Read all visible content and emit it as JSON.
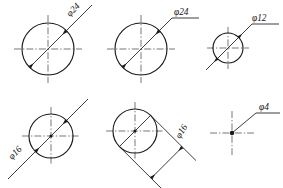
{
  "drawing": {
    "title": "Diameter dimensioning examples",
    "page_background": "#ffffff",
    "line_color": "#1a1a1a",
    "centerline_color": "#3d3d3d",
    "figures": [
      {
        "id": "fig-1",
        "name": "circle-phi24-inline-rotated-label",
        "label": "φ24",
        "diameter_value": 24,
        "symbol": "φ",
        "label_orientation": "aligned",
        "center": {
          "x": 48,
          "y": 49
        },
        "radius": 26,
        "dimension_line_angle_deg": -45,
        "arrows": "inside-both-ends",
        "label_position": {
          "x": 70,
          "y": 17
        }
      },
      {
        "id": "fig-2",
        "name": "circle-phi24-leader-shelf-label",
        "label": "φ24",
        "diameter_value": 24,
        "symbol": "φ",
        "label_orientation": "horizontal",
        "center": {
          "x": 141,
          "y": 49
        },
        "radius": 26,
        "dimension_line_angle_deg": -45,
        "arrows": "inside-both-ends",
        "label_position": {
          "x": 174,
          "y": 16
        }
      },
      {
        "id": "fig-3",
        "name": "circle-phi12-outside-arrows-leader-label",
        "label": "φ12",
        "diameter_value": 12,
        "symbol": "φ",
        "label_orientation": "horizontal",
        "center": {
          "x": 228,
          "y": 48
        },
        "radius": 15,
        "dimension_line_angle_deg": -45,
        "arrows": "outside-pointing-in",
        "label_position": {
          "x": 249,
          "y": 20
        }
      },
      {
        "id": "fig-4",
        "name": "circle-phi16-extended-line-rotated-label",
        "label": "φ16",
        "diameter_value": 16,
        "symbol": "φ",
        "label_orientation": "aligned",
        "center": {
          "x": 51,
          "y": 136
        },
        "radius": 22,
        "dimension_line_angle_deg": -45,
        "arrows": "inside-both-ends",
        "label_position": {
          "x": 16,
          "y": 163
        }
      },
      {
        "id": "fig-5",
        "name": "circle-phi16-offset-dimension-line-rotated-label",
        "label": "φ16",
        "diameter_value": 16,
        "symbol": "φ",
        "label_orientation": "aligned",
        "center": {
          "x": 135,
          "y": 131
        },
        "radius": 22,
        "dimension_line_angle_deg": -45,
        "arrows": "offset-extension-lines",
        "label_position": {
          "x": 186,
          "y": 129
        }
      },
      {
        "id": "fig-6",
        "name": "center-mark-phi4-leader-shelf-label",
        "label": "φ4",
        "diameter_value": 4,
        "symbol": "φ",
        "label_orientation": "horizontal",
        "center": {
          "x": 232,
          "y": 133
        },
        "radius": 2,
        "arrows": "leader-dot",
        "label_position": {
          "x": 263,
          "y": 110
        }
      }
    ]
  }
}
